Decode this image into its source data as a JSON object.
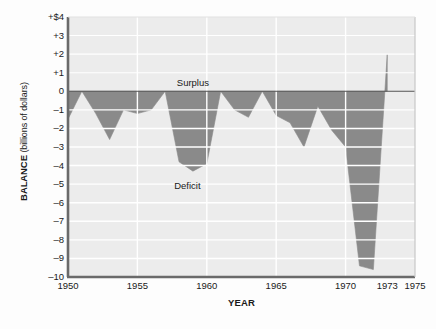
{
  "chart_data": {
    "type": "area",
    "title": "",
    "xlabel": "YEAR",
    "ylabel": "BALANCE",
    "ylabel_unit": "(billions of dollars)",
    "xlim": [
      1950,
      1975
    ],
    "ylim": [
      -10,
      4
    ],
    "grid": true,
    "legend": "none",
    "series_name": "Balance of payments",
    "x": [
      1950,
      1951,
      1952,
      1953,
      1954,
      1955,
      1956,
      1957,
      1958,
      1959,
      1960,
      1961,
      1962,
      1963,
      1964,
      1965,
      1966,
      1967,
      1968,
      1969,
      1970,
      1971,
      1972,
      1973
    ],
    "values": [
      -1.5,
      0.0,
      -1.2,
      -2.6,
      -1.0,
      -1.2,
      -1.0,
      0.0,
      -3.8,
      -4.3,
      -3.9,
      0.0,
      -1.0,
      -1.4,
      0.0,
      -1.3,
      -1.7,
      -3.0,
      -0.8,
      -2.1,
      -3.0,
      -9.4,
      -9.6,
      2.0
    ],
    "x_ticks": [
      {
        "value": 1950,
        "label": "1950"
      },
      {
        "value": 1955,
        "label": "1955"
      },
      {
        "value": 1960,
        "label": "1960"
      },
      {
        "value": 1965,
        "label": "1965"
      },
      {
        "value": 1970,
        "label": "1970"
      },
      {
        "value": 1973,
        "label": "1973"
      },
      {
        "value": 1975,
        "label": "1975"
      }
    ],
    "y_ticks": [
      {
        "value": 4,
        "label": "+$4"
      },
      {
        "value": 3,
        "label": "+3"
      },
      {
        "value": 2,
        "label": "+2"
      },
      {
        "value": 1,
        "label": "+1"
      },
      {
        "value": 0,
        "label": "0"
      },
      {
        "value": -1,
        "label": "–1"
      },
      {
        "value": -2,
        "label": "–2"
      },
      {
        "value": -3,
        "label": "–3"
      },
      {
        "value": -4,
        "label": "–4"
      },
      {
        "value": -5,
        "label": "–5"
      },
      {
        "value": -6,
        "label": "–6"
      },
      {
        "value": -7,
        "label": "–7"
      },
      {
        "value": -8,
        "label": "–8"
      },
      {
        "value": -9,
        "label": "–9"
      },
      {
        "value": -10,
        "label": "–10"
      }
    ],
    "annotations": [
      {
        "text": "Surplus",
        "x": 1959.0,
        "y": 0.45,
        "name": "surplus-label"
      },
      {
        "text": "Deficit",
        "x": 1958.6,
        "y": -5.1,
        "name": "deficit-label"
      }
    ],
    "colors": {
      "fill": "#8a8a8a",
      "plot_background": "#ececec",
      "gridline": "#ffffff",
      "axis": "#6a6a6a",
      "zero_line": "#555555",
      "text": "#1a1a1a"
    }
  }
}
